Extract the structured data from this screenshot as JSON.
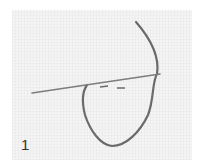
{
  "figure": {
    "step_label": "1",
    "colors": {
      "fabric": "#f4f4f4",
      "thread": "#6a6a6a",
      "needle": "#7d7d7d"
    }
  }
}
